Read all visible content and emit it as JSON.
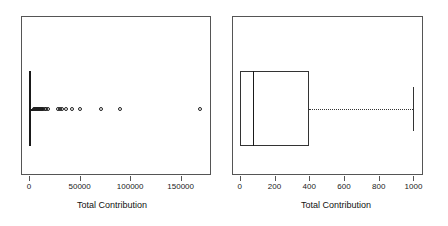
{
  "figure": {
    "width": 448,
    "height": 226,
    "background": "#ffffff",
    "panel_count": 2
  },
  "chart_data": [
    {
      "type": "box",
      "panel": "left",
      "title": "",
      "xlabel": "Total Contribution",
      "ylabel": "",
      "orientation": "horizontal",
      "grid": false,
      "legend": null,
      "xlim": [
        -8000,
        180000
      ],
      "xticks": [
        0,
        50000,
        100000,
        150000
      ],
      "xticklabels": [
        "0",
        "50000",
        "100000",
        "150000"
      ],
      "box": {
        "min_whisker": 0,
        "q1": 0,
        "median": 700,
        "q3": 2200,
        "max_whisker": 4500
      },
      "outliers": [
        5200,
        5800,
        6400,
        7000,
        7600,
        8200,
        8800,
        9400,
        10200,
        11000,
        11800,
        12600,
        13500,
        15600,
        17200,
        18800,
        29000,
        30500,
        33000,
        36500,
        42000,
        50500,
        71000,
        90000,
        169000
      ],
      "note": "Heavily right-skewed distribution; box is compressed at origin with many extreme outliers."
    },
    {
      "type": "box",
      "panel": "right",
      "title": "",
      "xlabel": "Total Contribution",
      "ylabel": "",
      "orientation": "horizontal",
      "grid": false,
      "legend": null,
      "xlim": [
        -45,
        1055
      ],
      "xticks": [
        0,
        200,
        400,
        600,
        800,
        1000
      ],
      "xticklabels": [
        "0",
        "200",
        "400",
        "600",
        "800",
        "1000"
      ],
      "box": {
        "min_whisker": 0,
        "q1": 0,
        "median": 75,
        "q3": 400,
        "max_whisker": 1000
      },
      "outliers": [],
      "note": "Zoomed view of the same variable truncated to 0-1000; whisker extends to 1000."
    }
  ],
  "panels": {
    "left": {
      "axis_title": "Total Contribution",
      "tick_labels": [
        "0",
        "50000",
        "100000",
        "150000"
      ]
    },
    "right": {
      "axis_title": "Total Contribution",
      "tick_labels": [
        "0",
        "200",
        "400",
        "600",
        "800",
        "1000"
      ]
    }
  },
  "colors": {
    "frame": "#555555",
    "ink": "#1a1a1a",
    "background": "#ffffff"
  }
}
